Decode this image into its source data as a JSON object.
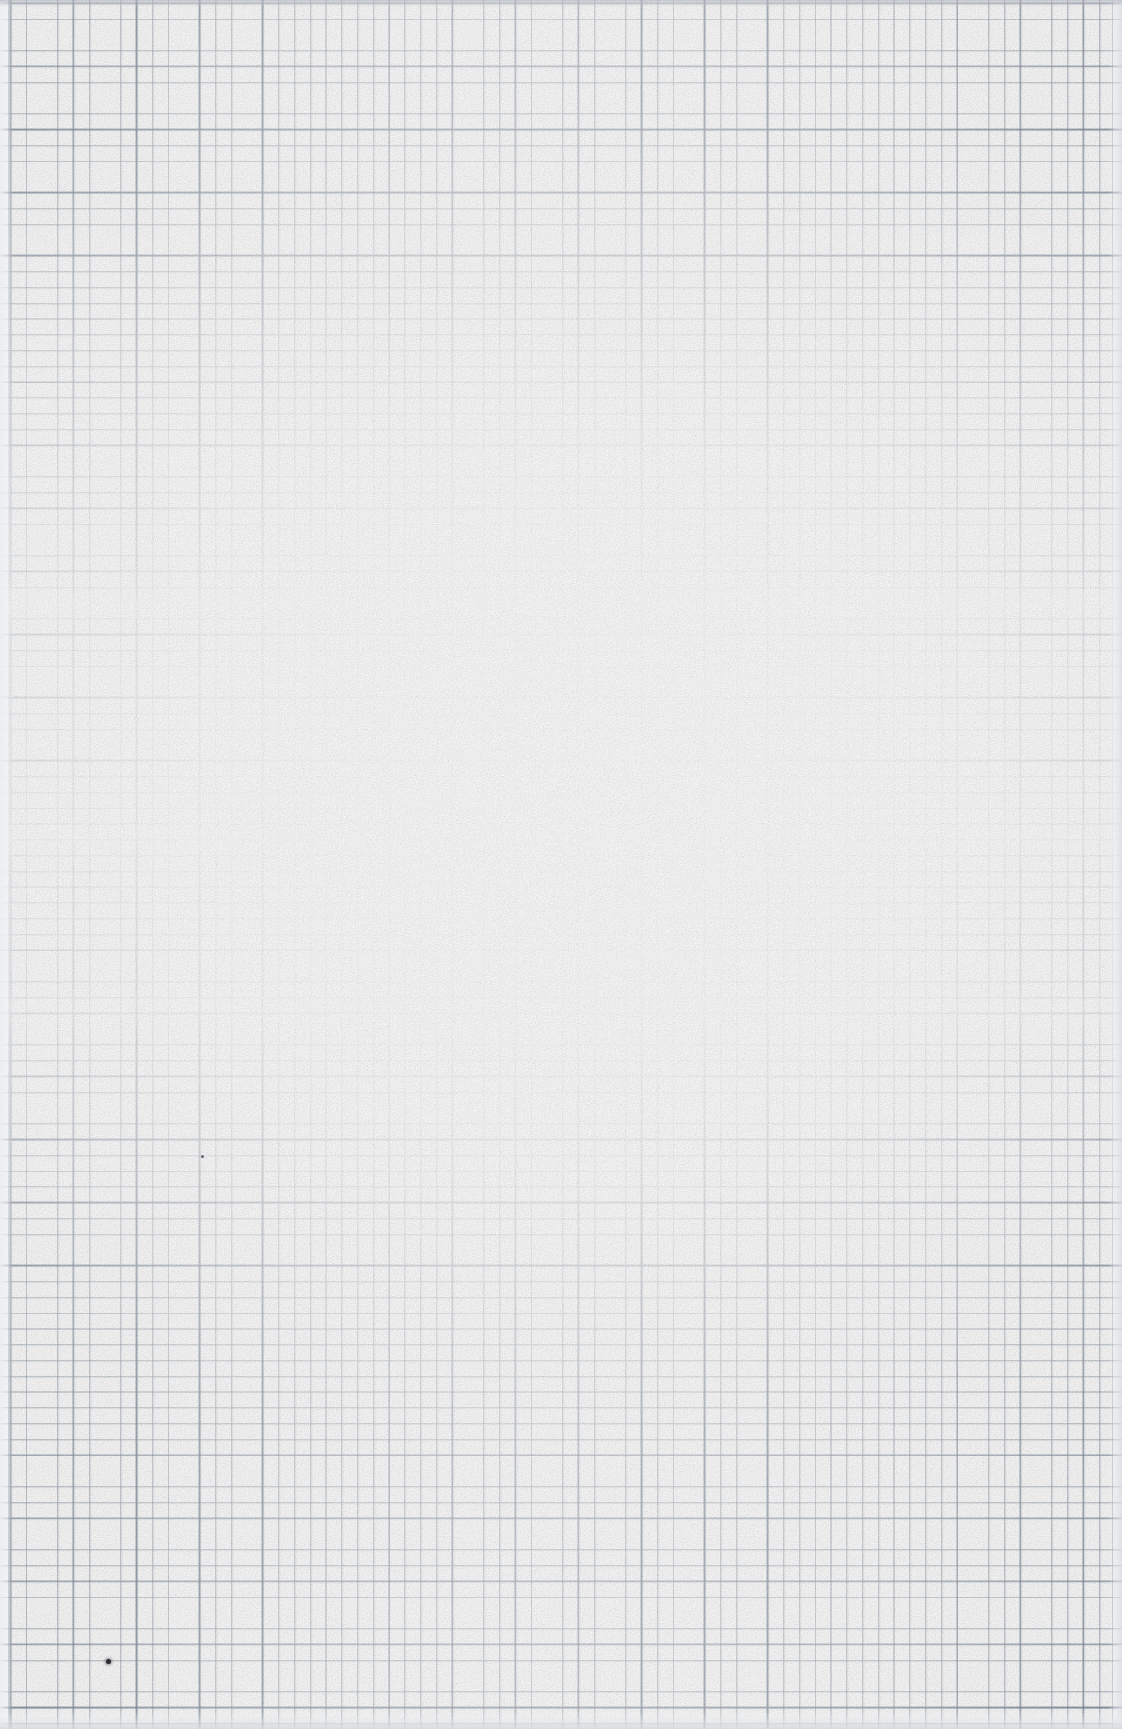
{
  "document": {
    "kind": "scanned-paper-sheet",
    "title": "",
    "visible_text": "",
    "page_width_px": 1122,
    "page_height_px": 1729,
    "paper": {
      "type": "graph-paper",
      "color_hex": "#fdfdfd",
      "ink_color_hex": "#788696",
      "fine_grid_pitch_px": 15.8,
      "major_grid_every_n_cells": 4,
      "major_grid_pitch_px": 63.1
    },
    "marks": [
      {
        "name": "pen-dot",
        "shape": "dot",
        "x_px": 108,
        "y_px": 1661,
        "diameter_px": 5,
        "color_hex": "#2b2d30"
      },
      {
        "name": "faint-speck",
        "shape": "dot",
        "x_px": 202,
        "y_px": 1156,
        "diameter_px": 3,
        "color_hex": "#60646c"
      }
    ],
    "scan_artifacts": {
      "top_edge_band_hex": "#a8aeb6",
      "bottom_edge_band_hex": "#d6dadf",
      "right_edge_band_hex": "#dbdfe4",
      "left_edge_band_hex": "#ecedf1",
      "center_washout": "strong",
      "description": "Blank sheet of fine graph paper, photographed or scanned with heavy exposure washout toward the centre of the page; grid is legible only near the margins."
    }
  }
}
